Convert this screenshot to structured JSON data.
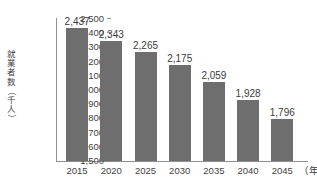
{
  "chart_data": {
    "type": "bar",
    "title": "",
    "subtitle": "",
    "xlabel": "年",
    "ylabel": "就業者数（千人）",
    "categories": [
      "2015",
      "2020",
      "2025",
      "2030",
      "2035",
      "2040",
      "2045"
    ],
    "values": [
      2437,
      2343,
      2265,
      2175,
      2059,
      1928,
      1796
    ],
    "value_labels": [
      "2,437",
      "2,343",
      "2,265",
      "2,175",
      "2,059",
      "1,928",
      "1,796"
    ],
    "ylim": [
      1500,
      2500
    ],
    "ytick_values": [
      2500,
      2400,
      2300,
      2200,
      2100,
      2000,
      1900,
      1800,
      1700,
      1600,
      1500
    ],
    "ytick_labels": [
      "2,500",
      "2,400",
      "2,300",
      "2,200",
      "2,100",
      "2,000",
      "1,900",
      "1,800",
      "1,700",
      "1,600",
      "1,500"
    ],
    "grid": false,
    "legend": null,
    "legend_position": "none",
    "bar_color": "#6e6e6e",
    "axis_color": "#8f8f8f",
    "text_color": "#3f3f3f",
    "background": "#ffffff",
    "x_unit_label": "（年）",
    "ylabel_chars": [
      "就",
      "業",
      "者",
      "数",
      "（",
      "千",
      "人",
      "）"
    ]
  }
}
